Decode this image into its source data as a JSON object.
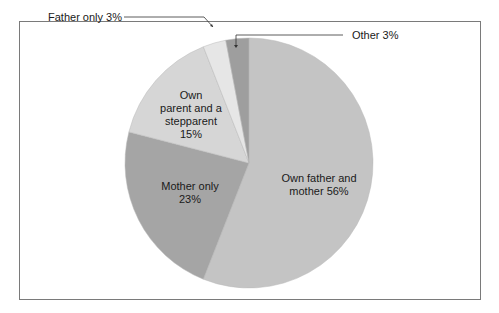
{
  "chart_data": {
    "type": "pie",
    "title": "",
    "categories": [
      "Own father and mother",
      "Mother only",
      "Own parent and a stepparent",
      "Father only",
      "Other"
    ],
    "values": [
      56,
      23,
      15,
      3,
      3
    ],
    "unit": "%",
    "colors": [
      "#c4c4c4",
      "#a5a5a5",
      "#d6d6d6",
      "#e6e6e6",
      "#9e9e9e"
    ],
    "start_angle_deg": 0,
    "direction": "clockwise from 12 o'clock",
    "labels": [
      {
        "text": "Own father and mother 56%",
        "position": "inside"
      },
      {
        "text": "Mother only 23%",
        "position": "inside"
      },
      {
        "text": "Own parent and a stepparent 15%",
        "position": "inside"
      },
      {
        "text": "Father only 3%",
        "position": "outside-leader"
      },
      {
        "text": "Other 3%",
        "position": "outside-leader"
      }
    ],
    "legend": "none"
  },
  "labels": {
    "own_father_mother_1": "Own father and",
    "own_father_mother_2": "mother 56%",
    "mother_only_1": "Mother only",
    "mother_only_2": "23%",
    "stepparent_1": "Own",
    "stepparent_2": "parent and a",
    "stepparent_3": "stepparent",
    "stepparent_4": "15%",
    "father_only": "Father only 3%",
    "other": "Other 3%"
  }
}
